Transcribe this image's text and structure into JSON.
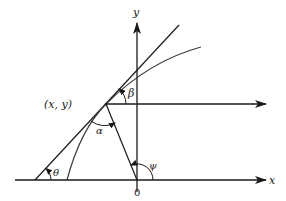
{
  "diagram": {
    "type": "geometry",
    "colors": {
      "ink": "#1a1a1a",
      "curve": "#3a3a3a",
      "background": "#ffffff"
    },
    "axes": {
      "x_label": "x",
      "y_label": "y",
      "origin_label": "0"
    },
    "point": {
      "label": "(x, y)"
    },
    "angles": {
      "theta": "θ",
      "alpha": "α",
      "beta": "β",
      "psi": "ψ"
    }
  }
}
